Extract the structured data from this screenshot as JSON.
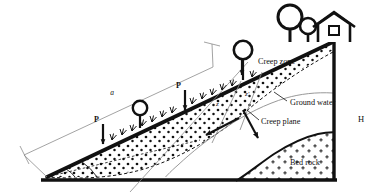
{
  "figure": {
    "background": "#ffffff",
    "ink": "#111111",
    "thin_line": "#8c8c8c"
  },
  "labels": {
    "creep_zone": "Creep zone",
    "ground_water": "Ground water",
    "creep_plane": "Creep plane",
    "bed_rock": "Bed rock",
    "height_symbol": "H",
    "slope_length_symbol": "a",
    "depth_symbol": "z",
    "depth_prime_symbol": "z'",
    "load_symbol_1": "P",
    "load_symbol_2": "P",
    "load_symbol_3": "P"
  },
  "annotations": {
    "loads": [
      {
        "name": "load-arrow-lower",
        "label": "P"
      },
      {
        "name": "load-arrow-middle",
        "label": "P"
      },
      {
        "name": "load-arrow-upper",
        "label": "P"
      }
    ],
    "vectors": [
      {
        "name": "creep-direction-arrow",
        "description": "downslope movement arrow"
      },
      {
        "name": "gravity-arrow",
        "description": "vertical load arrow"
      }
    ],
    "angles": [
      {
        "name": "slope-angle-outer"
      },
      {
        "name": "slope-angle-inner"
      }
    ]
  },
  "legend_items": [
    {
      "key": "creep-zone",
      "label": "Creep zone",
      "pattern": "dots"
    },
    {
      "key": "ground-water",
      "label": "Ground water",
      "pattern": "thin-curve"
    },
    {
      "key": "creep-plane",
      "label": "Creep plane",
      "pattern": "dashed-curve"
    },
    {
      "key": "bed-rock",
      "label": "Bed rock",
      "pattern": "plus-signs"
    }
  ],
  "scene_objects": [
    {
      "key": "house",
      "label": "house"
    },
    {
      "key": "tree-large",
      "label": "tree"
    },
    {
      "key": "tree-small",
      "label": "tree"
    },
    {
      "key": "tree-mid",
      "label": "tree"
    },
    {
      "key": "tree-low",
      "label": "tree"
    },
    {
      "key": "grass-tufts",
      "label": "vegetation"
    }
  ]
}
